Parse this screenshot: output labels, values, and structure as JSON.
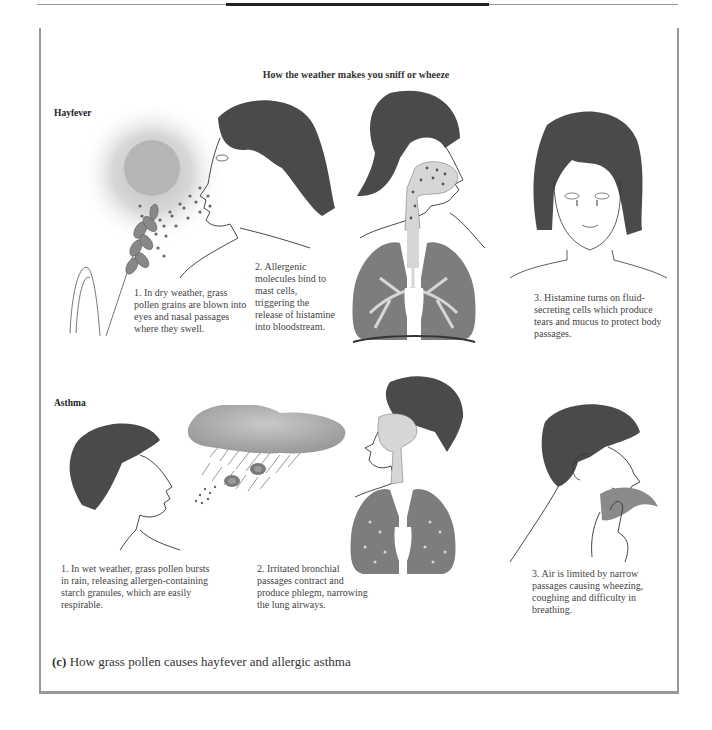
{
  "figure": {
    "title": "How the weather makes you sniff or wheeze",
    "caption_letter": "(c)",
    "caption_text": "How grass pollen causes hayfever and allergic asthma",
    "colors": {
      "hair": "#4a4a4a",
      "pollen": "#6e6e6e",
      "lungs": "#7d7d7d",
      "airway": "#dcdcdc",
      "sun_glow": "#c9c9c9",
      "cloud": "#a8a8a8",
      "line": "#333333",
      "frame": "#999999"
    }
  },
  "sections": [
    {
      "label": "Hayfever",
      "steps": [
        {
          "text": "1. In dry weather, grass pollen grains are blown into eyes and nasal passages where they swell.",
          "lines": [
            "1. In dry weather, grass",
            "pollen grains are blown into",
            "eyes and nasal passages",
            "where they swell."
          ],
          "illustration": "sun-pollen-profile-woman"
        },
        {
          "text": "2. Allergenic molecules bind to mast cells, triggering the release of histamine into bloodstream.",
          "lines": [
            "2. Allergenic",
            "molecules bind",
            "to mast cells,",
            "triggering the",
            "release of",
            "histamine into",
            "bloodstream."
          ],
          "illustration": "woman-airway-lungs"
        },
        {
          "text": "3. Histamine turns on fluid-secreting cells which produce tears and mucus to protect body passages.",
          "lines": [
            "3. Histamine turns on",
            "fluid-secreting cells which",
            "produce tears and mucus to",
            "protect body passages."
          ],
          "illustration": "crying-woman-front"
        }
      ]
    },
    {
      "label": "Asthma",
      "steps": [
        {
          "text": "1. In wet weather, grass pollen bursts in rain, releasing allergen-containing starch granules, which are easily respirable.",
          "lines": [
            "1. In wet weather, grass pollen",
            "bursts in rain, releasing",
            "allergen-containing starch",
            "granules, which are easily",
            "respirable."
          ],
          "illustration": "rain-cloud-boy"
        },
        {
          "text": "2. Irritated bronchial passages contract and produce phlegm, narrowing the lung airways.",
          "lines": [
            "2. Irritated bronchial",
            "passages contract and",
            "produce phlegm,",
            "narrowing the lung",
            "airways."
          ],
          "illustration": "boy-airway-lungs"
        },
        {
          "text": "3. Air is limited by narrow passages causing wheezing, coughing and difficulty in breathing.",
          "lines": [
            "3. Air is limited by narrow",
            "passages causing wheezing,",
            "coughing and difficulty in",
            "breathing."
          ],
          "illustration": "coughing-boy-handkerchief"
        }
      ]
    }
  ]
}
